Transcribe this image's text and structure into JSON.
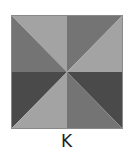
{
  "figure": {
    "label": "K",
    "pattern": "pinwheel-8-triangles",
    "colors": {
      "light": "#a3a3a3",
      "medium": "#747474",
      "dark": "#4a4a4a",
      "border": "#8a8a8a"
    },
    "triangles": [
      {
        "quadrant": "top-left",
        "half": "upper-right",
        "shade": "light"
      },
      {
        "quadrant": "top-left",
        "half": "lower-left",
        "shade": "medium"
      },
      {
        "quadrant": "top-right",
        "half": "upper-left",
        "shade": "medium"
      },
      {
        "quadrant": "top-right",
        "half": "lower-right",
        "shade": "light"
      },
      {
        "quadrant": "bottom-left",
        "half": "upper-left",
        "shade": "dark"
      },
      {
        "quadrant": "bottom-left",
        "half": "lower-right",
        "shade": "light"
      },
      {
        "quadrant": "bottom-right",
        "half": "upper-right",
        "shade": "dark"
      },
      {
        "quadrant": "bottom-right",
        "half": "lower-left",
        "shade": "medium"
      }
    ]
  }
}
